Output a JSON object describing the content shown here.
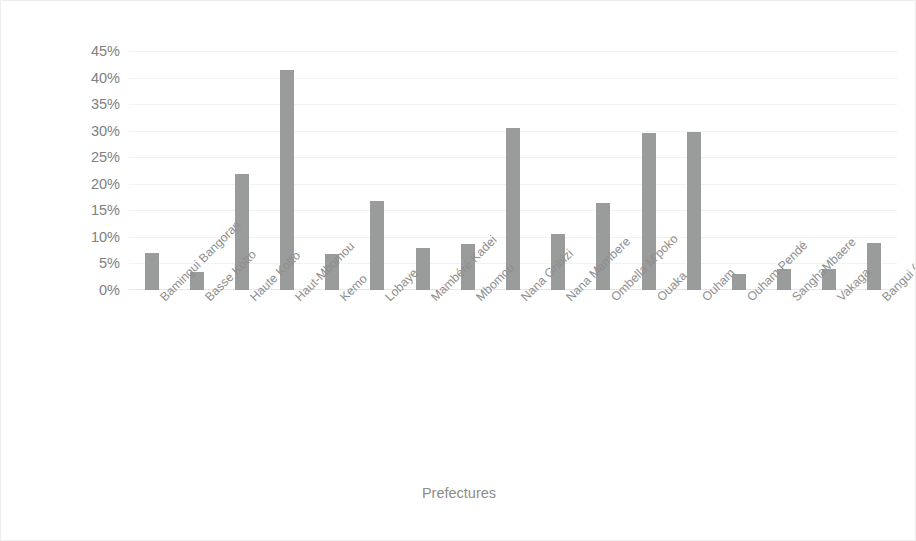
{
  "chart_data": {
    "type": "bar",
    "title": "",
    "xlabel": "Prefectures",
    "ylabel": "percentage of IDPs",
    "ylim": [
      0,
      45
    ],
    "ytick_step": 5,
    "ytick_labels": [
      "45%",
      "40%",
      "35%",
      "30%",
      "25%",
      "20%",
      "15%",
      "10%",
      "5%",
      "0%"
    ],
    "grid": true,
    "legend": "none",
    "bar_color": "#9a9b9b",
    "categories": [
      "Bamingui Bangoran",
      "Basse Kotto",
      "Haute Kotto",
      "Haut-Mbomou",
      "Kemo",
      "Lobaye",
      "Mambéré Kadei",
      "Mbomou",
      "Nana Gribizi",
      "Nana Mambere",
      "Ombella M'poko",
      "Ouaka",
      "Ouham",
      "Ouham Pendé",
      "SanghaMbaere",
      "Vakaga",
      "Bangui (autonomous commune)"
    ],
    "values": [
      7.0,
      3.3,
      21.8,
      41.5,
      6.7,
      16.7,
      8.0,
      8.6,
      30.5,
      10.6,
      16.4,
      29.5,
      29.8,
      3.0,
      3.9,
      4.0,
      8.8
    ]
  }
}
